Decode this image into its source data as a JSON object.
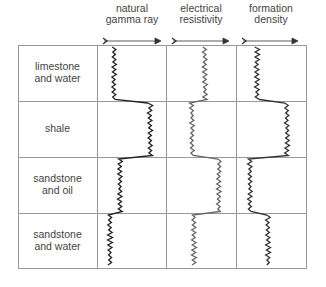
{
  "diagram": {
    "columns": [
      {
        "label_line1": "natural",
        "label_line2": "gamma ray"
      },
      {
        "label_line1": "electrical",
        "label_line2": "resistivity"
      },
      {
        "label_line1": "formation",
        "label_line2": "density"
      }
    ],
    "rows": [
      {
        "label_line1": "limestone",
        "label_line2": "and water"
      },
      {
        "label_line1": "shale",
        "label_line2": ""
      },
      {
        "label_line1": "sandstone",
        "label_line2": "and oil"
      },
      {
        "label_line1": "sandstone",
        "label_line2": "and water"
      }
    ],
    "log_positions": {
      "note": "approximate horizontal x-position (px) of each log trace per row",
      "natural_gamma_ray": [
        114,
        150,
        120,
        110
      ],
      "electrical_resistivity": [
        205,
        192,
        219,
        194
      ],
      "formation_density": [
        257,
        287,
        250,
        268
      ]
    },
    "colors": {
      "grid": "#999999",
      "gamma_trace": "#222222",
      "resistivity_trace": "#666666",
      "density_trace": "#333333",
      "text": "#444444"
    }
  }
}
